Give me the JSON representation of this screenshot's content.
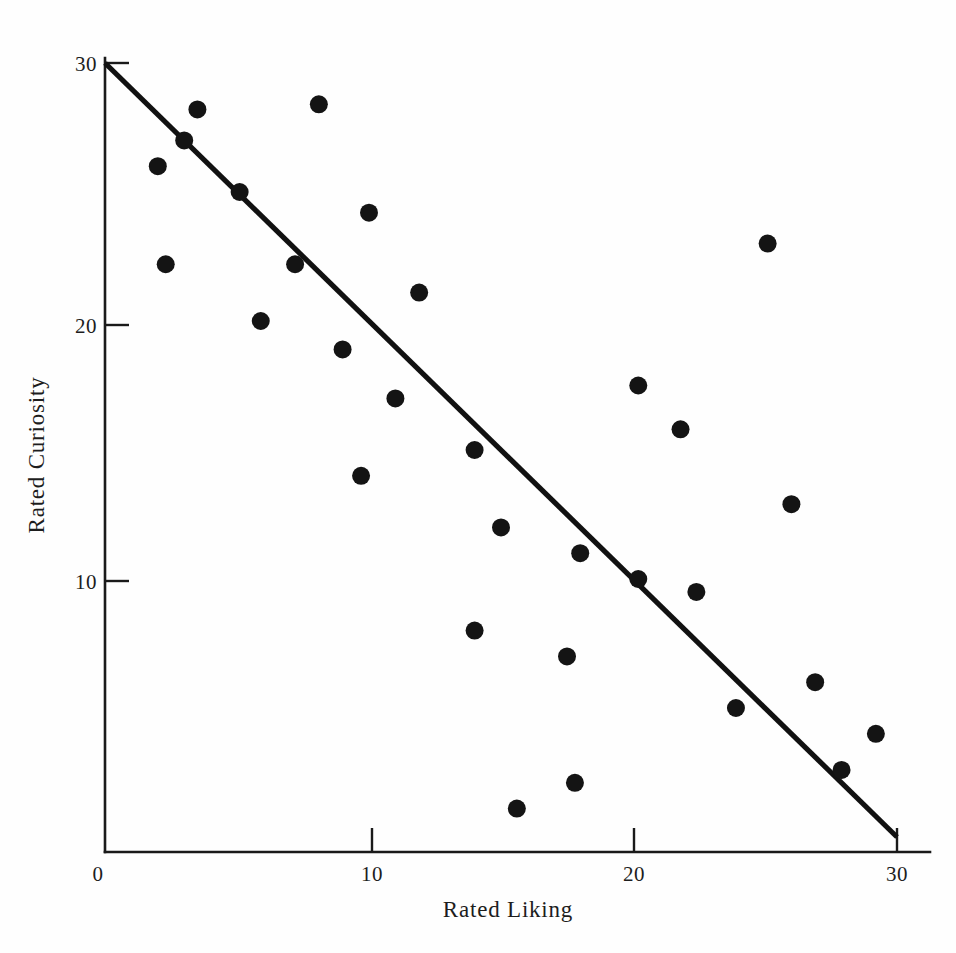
{
  "figure": {
    "background_color": "#fefefe",
    "ink_color": "#141414",
    "xlabel": "Rated Liking",
    "ylabel": "Rated Curiosity"
  },
  "axes": {
    "x_tick_labels": [
      "0",
      "10",
      "20",
      "30"
    ],
    "y_tick_labels": [
      "10",
      "20",
      "30"
    ],
    "x_origin_label": "0"
  },
  "chart_data": {
    "type": "scatter",
    "title": "",
    "subtitle": "",
    "xlabel": "Rated Liking",
    "ylabel": "Rated Curiosity",
    "xlim": [
      0,
      30
    ],
    "ylim": [
      0,
      30
    ],
    "xticks": [
      0,
      10,
      20,
      30
    ],
    "yticks": [
      10,
      20,
      30
    ],
    "grid": false,
    "legend": null,
    "point_marker": "filled-circle",
    "point_color": "#141414",
    "point_radius_px": 9,
    "series": [
      {
        "name": "Participants",
        "points": [
          [
            2.0,
            26.0
          ],
          [
            2.3,
            22.2
          ],
          [
            3.0,
            27.0
          ],
          [
            3.5,
            28.2
          ],
          [
            5.1,
            25.0
          ],
          [
            5.9,
            20.0
          ],
          [
            7.2,
            22.2
          ],
          [
            8.1,
            28.4
          ],
          [
            9.0,
            18.9
          ],
          [
            9.7,
            14.0
          ],
          [
            10.0,
            24.2
          ],
          [
            11.0,
            17.0
          ],
          [
            11.9,
            21.1
          ],
          [
            14.0,
            15.0
          ],
          [
            14.0,
            8.0
          ],
          [
            15.0,
            12.0
          ],
          [
            15.6,
            1.1
          ],
          [
            17.5,
            7.0
          ],
          [
            17.8,
            2.1
          ],
          [
            18.0,
            11.0
          ],
          [
            20.2,
            17.5
          ],
          [
            20.2,
            10.0
          ],
          [
            21.8,
            15.8
          ],
          [
            22.4,
            9.5
          ],
          [
            23.9,
            5.0
          ],
          [
            25.1,
            23.0
          ],
          [
            26.0,
            12.9
          ],
          [
            26.9,
            6.0
          ],
          [
            27.9,
            2.6
          ],
          [
            29.2,
            4.0
          ]
        ]
      }
    ],
    "reference_line": {
      "name": "perfect-negative-relation",
      "from": [
        0,
        30
      ],
      "to": [
        30,
        0
      ],
      "slope": -1,
      "intercept": 30,
      "color": "#111111"
    },
    "annotations": []
  }
}
